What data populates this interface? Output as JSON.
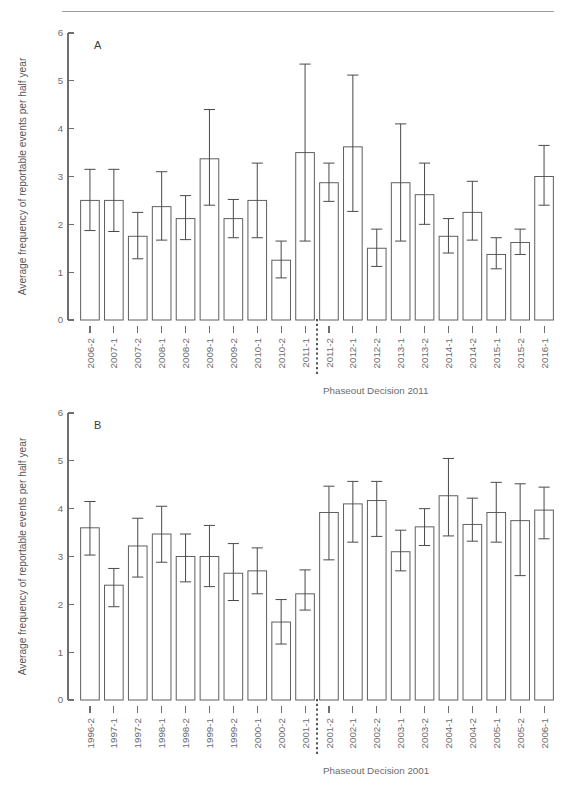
{
  "figure": {
    "background": "#ffffff",
    "rule_color": "#9a9a9c",
    "bar_stroke": "#5f5f61",
    "error_stroke": "#4a4a4c",
    "axis_color": "#6f6f71",
    "marker_line_color": "#2c2c2e"
  },
  "panelA": {
    "letter": "A",
    "ylabel": "Average frequency of reportable events per half year",
    "caption": "Phaseout Decision 2011",
    "marker_after_index": 9
  },
  "panelB": {
    "letter": "B",
    "ylabel": "Average frequency of reportable events per half year",
    "caption": "Phaseout Decision 2001",
    "marker_after_index": 9
  },
  "chart_data": [
    {
      "type": "bar",
      "panel": "A",
      "title": "",
      "xlabel": "Phaseout Decision 2011",
      "ylabel": "Average frequency of reportable events per half year",
      "ylim": [
        0,
        6
      ],
      "yticks": [
        0,
        1,
        2,
        3,
        4,
        5,
        6
      ],
      "ytick_labels": [
        "0",
        "1",
        "2",
        "3",
        "4",
        "5",
        "6"
      ],
      "grid": false,
      "legend": "none",
      "error_bar_type": "confidence interval",
      "vertical_marker": {
        "label": "Phaseout Decision 2011",
        "between_categories": [
          "2011-1",
          "2011-2"
        ],
        "style": "dotted"
      },
      "categories": [
        "2006-2",
        "2007-1",
        "2007-2",
        "2008-1",
        "2008-2",
        "2009-1",
        "2009-2",
        "2010-1",
        "2010-2",
        "2011-1",
        "2011-2",
        "2012-1",
        "2012-2",
        "2013-1",
        "2013-2",
        "2014-1",
        "2014-2",
        "2015-1",
        "2015-2",
        "2016-1"
      ],
      "values": [
        2.5,
        2.5,
        1.75,
        2.37,
        2.12,
        3.37,
        2.12,
        2.5,
        1.25,
        3.5,
        2.87,
        3.62,
        1.5,
        2.87,
        2.62,
        1.75,
        2.25,
        1.37,
        1.62,
        3.0
      ],
      "err_low": [
        1.87,
        1.85,
        1.28,
        1.67,
        1.68,
        2.4,
        1.72,
        1.72,
        0.88,
        1.65,
        2.48,
        2.27,
        1.12,
        1.65,
        2.0,
        1.4,
        1.67,
        1.07,
        1.37,
        2.4
      ],
      "err_high": [
        3.15,
        3.15,
        2.25,
        3.1,
        2.6,
        4.4,
        2.52,
        3.28,
        1.65,
        5.35,
        3.28,
        5.12,
        1.9,
        4.1,
        3.28,
        2.12,
        2.9,
        1.72,
        1.9,
        3.65
      ]
    },
    {
      "type": "bar",
      "panel": "B",
      "title": "",
      "xlabel": "Phaseout Decision 2001",
      "ylabel": "Average frequency of reportable events per half year",
      "ylim": [
        0,
        6
      ],
      "yticks": [
        0,
        1,
        2,
        3,
        4,
        5,
        6
      ],
      "ytick_labels": [
        "0",
        "1",
        "2",
        "3",
        "4",
        "5",
        "6"
      ],
      "grid": false,
      "legend": "none",
      "error_bar_type": "confidence interval",
      "vertical_marker": {
        "label": "Phaseout Decision 2001",
        "between_categories": [
          "2001-1",
          "2001-2"
        ],
        "style": "dotted"
      },
      "categories": [
        "1996-2",
        "1997-1",
        "1997-2",
        "1998-1",
        "1998-2",
        "1999-1",
        "1999-2",
        "2000-1",
        "2000-2",
        "2001-1",
        "2001-2",
        "2002-1",
        "2002-2",
        "2003-1",
        "2003-2",
        "2004-1",
        "2004-2",
        "2005-1",
        "2005-2",
        "2006-1"
      ],
      "values": [
        3.6,
        2.4,
        3.22,
        3.47,
        3.0,
        3.0,
        2.65,
        2.7,
        1.63,
        2.22,
        3.92,
        4.1,
        4.17,
        3.1,
        3.62,
        4.27,
        3.67,
        3.92,
        3.75,
        3.97
      ],
      "err_low": [
        3.03,
        1.95,
        2.57,
        2.88,
        2.47,
        2.37,
        2.08,
        2.22,
        1.17,
        1.88,
        2.93,
        3.3,
        3.42,
        2.7,
        3.23,
        3.43,
        3.32,
        3.3,
        2.6,
        3.37
      ],
      "err_high": [
        4.15,
        2.75,
        3.8,
        4.05,
        3.47,
        3.65,
        3.27,
        3.18,
        2.1,
        2.72,
        4.47,
        4.57,
        4.57,
        3.55,
        4.0,
        5.05,
        4.22,
        4.55,
        4.52,
        4.45
      ]
    }
  ]
}
